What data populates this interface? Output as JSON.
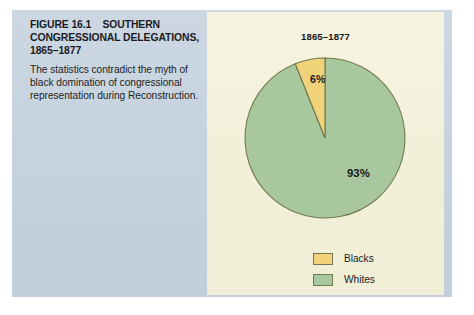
{
  "figure": {
    "label": "FIGURE 16.1",
    "subject": "SOUTHERN CONGRESSIONAL DELEGATIONS, 1865–1877",
    "caption": "The statistics contradict the myth of black domination of congressional representation during Reconstruction."
  },
  "chart_data": {
    "type": "pie",
    "title": "1865–1877",
    "categories": [
      "Blacks",
      "Whites"
    ],
    "values": [
      6,
      93
    ],
    "value_labels": [
      "6%",
      "93%"
    ],
    "colors": [
      "#efd27a",
      "#a9c79f"
    ],
    "stroke_color": "#6f7a4e",
    "legend_position": "bottom-right",
    "start_angle_deg": 0,
    "direction": "counterclockwise",
    "xlabel": "",
    "ylabel": ""
  },
  "legend": {
    "items": [
      {
        "label": "Blacks",
        "color": "#efd27a"
      },
      {
        "label": "Whites",
        "color": "#a9c79f"
      }
    ]
  },
  "palette": {
    "page_background": "#ffffff",
    "text_panel": "#c8d4e0",
    "chart_panel": "#f4f1dc",
    "blacks_slice": "#efd27a",
    "whites_slice": "#a9c79f",
    "slice_outline": "#6f7a4e",
    "text": "#1b1b1f"
  }
}
